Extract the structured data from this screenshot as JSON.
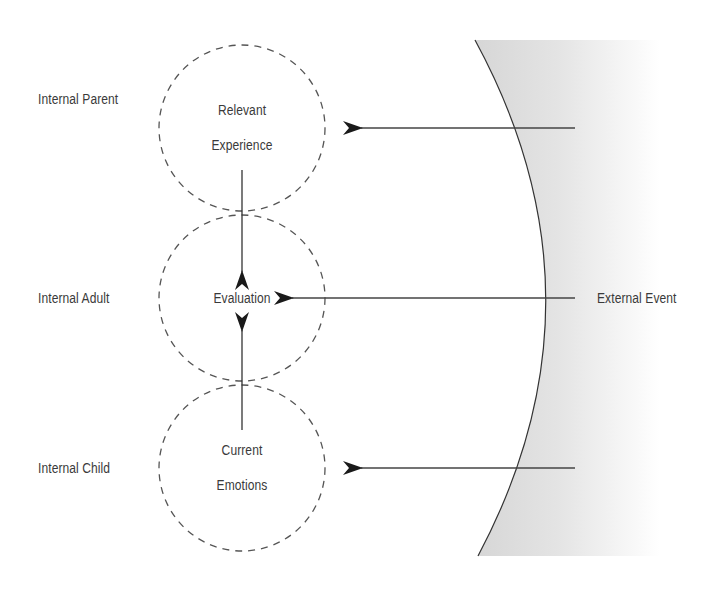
{
  "diagram": {
    "type": "ego-state-model",
    "colors": {
      "line": "#333333",
      "dashed_circle": "#555555",
      "text": "#3a3a3a",
      "external_fill_dark": "#d9d9d9",
      "external_fill_light": "#ffffff"
    },
    "ego_states": [
      {
        "id": "parent",
        "side_label": "Internal Parent",
        "circle_text_1": "Relevant",
        "circle_text_2": "Experience"
      },
      {
        "id": "adult",
        "side_label": "Internal Adult",
        "circle_text_1": "Evaluation",
        "circle_text_2": ""
      },
      {
        "id": "child",
        "side_label": "Internal Child",
        "circle_text_1": "Current",
        "circle_text_2": "Emotions"
      }
    ],
    "external": {
      "label": "External Event"
    },
    "edges": [
      {
        "from": "parent",
        "to": "adult",
        "direction": "down"
      },
      {
        "from": "child",
        "to": "adult",
        "direction": "up"
      },
      {
        "from": "external",
        "to": "parent",
        "direction": "left"
      },
      {
        "from": "external",
        "to": "adult",
        "direction": "left"
      },
      {
        "from": "external",
        "to": "child",
        "direction": "left"
      }
    ]
  }
}
